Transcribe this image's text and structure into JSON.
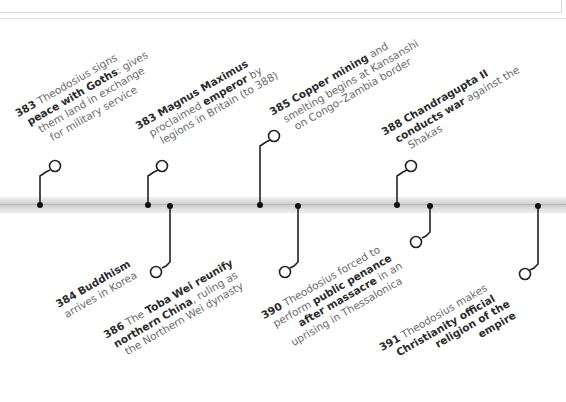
{
  "colors": {
    "text_regular": "#6a6a6a",
    "text_bold": "#2a2a2a",
    "connector": "#222222",
    "bar": "#d0d0d0"
  },
  "events": [
    {
      "id": "e1",
      "position": "above",
      "year": "383",
      "lines": [
        {
          "pre": " Theodosius signs",
          "bold": "",
          "post": ""
        },
        {
          "pre": "",
          "bold": "peace with Goths",
          "post": ": gives"
        },
        {
          "pre": "them land in exchange",
          "bold": "",
          "post": ""
        },
        {
          "pre": "for military service",
          "bold": "",
          "post": ""
        }
      ]
    },
    {
      "id": "e2",
      "position": "above",
      "year": "383",
      "lines": [
        {
          "pre": " ",
          "bold": "Magnus Maximus",
          "post": ""
        },
        {
          "pre": "proclaimed ",
          "bold": "emperor",
          "post": " by"
        },
        {
          "pre": "legions in Britain (to 388)",
          "bold": "",
          "post": ""
        }
      ]
    },
    {
      "id": "e3",
      "position": "above",
      "year": "385",
      "lines": [
        {
          "pre": " ",
          "bold": "Copper mining",
          "post": " and"
        },
        {
          "pre": "smelting begins at Kansanshi",
          "bold": "",
          "post": ""
        },
        {
          "pre": "on Congo–Zambia border",
          "bold": "",
          "post": ""
        }
      ]
    },
    {
      "id": "e4",
      "position": "above",
      "year": "388",
      "lines": [
        {
          "pre": " ",
          "bold": "Chandragupta II",
          "post": ""
        },
        {
          "pre": "",
          "bold": "conducts war",
          "post": " against the"
        },
        {
          "pre": "Shakas",
          "bold": "",
          "post": ""
        }
      ]
    },
    {
      "id": "e5",
      "position": "below",
      "year": "384",
      "lines": [
        {
          "pre": " ",
          "bold": "Buddhism",
          "post": ""
        },
        {
          "pre": "arrives in Korea",
          "bold": "",
          "post": ""
        }
      ]
    },
    {
      "id": "e6",
      "position": "below",
      "year": "386",
      "lines": [
        {
          "pre": " The ",
          "bold": "Toba Wei reunify",
          "post": ""
        },
        {
          "pre": "",
          "bold": "northern China",
          "post": ", ruling as"
        },
        {
          "pre": "the Northern Wei dynasty",
          "bold": "",
          "post": ""
        }
      ]
    },
    {
      "id": "e7",
      "position": "below",
      "year": "390",
      "lines": [
        {
          "pre": " Theodosius forced to",
          "bold": "",
          "post": ""
        },
        {
          "pre": "perform ",
          "bold": "public penance",
          "post": ""
        },
        {
          "pre": "",
          "bold": "after massacre",
          "post": " in an"
        },
        {
          "pre": "uprising in Thessalonica",
          "bold": "",
          "post": ""
        }
      ]
    },
    {
      "id": "e8",
      "position": "below",
      "year": "391",
      "lines": [
        {
          "pre": " Theodosius makes",
          "bold": "",
          "post": ""
        },
        {
          "pre": "",
          "bold": "Christianity official",
          "post": ""
        },
        {
          "pre": "",
          "bold": "religion of the",
          "post": ""
        },
        {
          "pre": "",
          "bold": "empire",
          "post": ""
        }
      ]
    }
  ]
}
